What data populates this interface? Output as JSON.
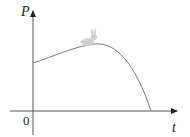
{
  "diagram": {
    "type": "graph-sketch",
    "y_axis": {
      "label": "P"
    },
    "x_axis": {
      "label": "t"
    },
    "origin_label": "0",
    "curve": {
      "description": "Population curve starting at positive P-intercept, rising to a maximum, then falling to zero",
      "color": "#777777"
    },
    "annotation": {
      "icon": "rabbit-icon",
      "position": "near curve maximum"
    },
    "colors": {
      "axes": "#444444",
      "curve": "#777777",
      "rabbit": "#cccccc"
    }
  }
}
